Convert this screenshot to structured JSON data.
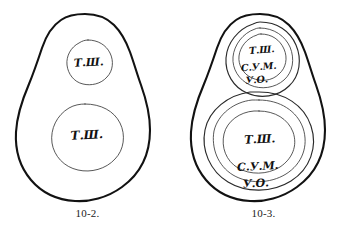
{
  "plate": {
    "background_color": "#ffffff",
    "ink_color": "#121212",
    "medium": "pen-and-ink line drawing"
  },
  "figures": [
    {
      "id": "fig-10-2",
      "caption": "10-2.",
      "outline_shape": "pear-shaped-outline",
      "regions": [
        {
          "id": "upper-region",
          "label": "Т.Ш.",
          "ring_count": 1,
          "position": "upper"
        },
        {
          "id": "lower-region",
          "label": "Т.Ш.",
          "ring_count": 1,
          "position": "lower"
        }
      ]
    },
    {
      "id": "fig-10-3",
      "caption": "10-3.",
      "outline_shape": "pear-shaped-outline",
      "regions": [
        {
          "id": "upper-region",
          "ring_count": 3,
          "position": "upper",
          "labels": [
            "Т.Ш.",
            "С.У.М.",
            "У.О."
          ]
        },
        {
          "id": "lower-region",
          "ring_count": 3,
          "position": "lower",
          "labels": [
            "Т.Ш.",
            "С.У.М.",
            "У.О."
          ]
        }
      ]
    }
  ],
  "labels": {
    "tsh": "Т.Ш.",
    "sum": "С.У.М.",
    "uo": "У.О."
  },
  "captions": {
    "left": "10-2.",
    "right": "10-3."
  }
}
